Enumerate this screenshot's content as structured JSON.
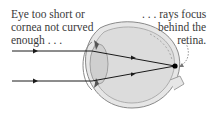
{
  "diagram": {
    "left_label": {
      "lines": [
        "Eye too short or",
        "cornea not curved",
        "enough . . ."
      ]
    },
    "right_label": {
      "lines": [
        ". . . rays focus",
        "behind the",
        "retina."
      ]
    },
    "elements": {
      "rays": 2,
      "focus_point": "behind the retina",
      "colors": {
        "ray": "#1a1a1a",
        "eye_outline": "#8a8a8a",
        "eye_fill": "#dcdcdc",
        "lens_fill": "#cfcfcf",
        "text": "#3a3a3a",
        "focus_dot": "#000000"
      }
    }
  }
}
